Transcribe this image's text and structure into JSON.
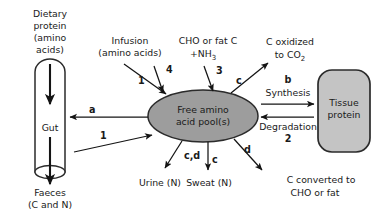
{
  "figure": {
    "title_text": "",
    "colors": {
      "background": "#ffffff",
      "text": "#1a1a1a",
      "pool_fill": "#9d9d9d",
      "pool_stroke": "#2b2b2b",
      "gut_fill": "#c9c9c9",
      "gut_stroke": "#2b2b2b",
      "tissue_fill": "#c4c4c4",
      "tissue_stroke": "#2b2b2b",
      "arrow": "#141414"
    }
  },
  "nodes": {
    "dietary_protein": {
      "lines": [
        "Dietary",
        "protein",
        "(amino",
        "acids)"
      ]
    },
    "gut": {
      "label": "Gut"
    },
    "faeces": {
      "lines": [
        "Faeces",
        "(C and N)"
      ]
    },
    "infusion": {
      "lines": [
        "Infusion",
        "(amino acids)"
      ]
    },
    "cho_fat_c": {
      "line1": "CHO or fat C",
      "line2_prefix": "+NH",
      "line2_sub": "3"
    },
    "c_oxidized": {
      "line1": "C oxidized",
      "line2_prefix": "to CO",
      "line2_sub": "2"
    },
    "free_amino_pool": {
      "line1": "Free amino",
      "line2": "acid pool(s)"
    },
    "tissue_protein": {
      "line1": "Tissue",
      "line2": "protein"
    },
    "urine": {
      "label": "Urine (N)"
    },
    "sweat": {
      "label": "Sweat (N)"
    },
    "c_converted": {
      "line1": "C converted to",
      "line2": "CHO or fat"
    },
    "synthesis": {
      "label": "Synthesis"
    },
    "degradation": {
      "label": "Degradation"
    }
  },
  "arrow_labels": {
    "infusion_to_pool": "1",
    "amino_into_pool_4": "4",
    "cho_fat_into_pool_3": "3",
    "pool_to_oxidized_c": "c",
    "synthesis_b": "b",
    "degradation_2": "2",
    "pool_to_gut_a": "a",
    "gut_to_pool_1": "1",
    "pool_to_urine_cd": "c,d",
    "pool_to_sweat_c": "c",
    "pool_to_cho_fat_d": "d"
  }
}
